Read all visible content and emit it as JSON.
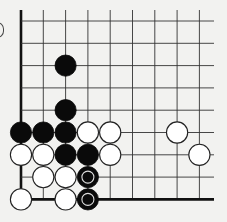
{
  "diagram": {
    "type": "go-board-corner",
    "visible_columns": 9,
    "visible_rows": 9,
    "edges": [
      "left",
      "bottom"
    ],
    "colors": {
      "background": "#f2f2f0",
      "line": "#333333",
      "black": "#0a0a0a",
      "white": "#ffffff"
    },
    "stones": [
      {
        "color": "black",
        "col": 2,
        "row": 2,
        "marked": false
      },
      {
        "color": "black",
        "col": 2,
        "row": 4,
        "marked": false
      },
      {
        "color": "black",
        "col": 0,
        "row": 5,
        "marked": false
      },
      {
        "color": "black",
        "col": 1,
        "row": 5,
        "marked": false
      },
      {
        "color": "black",
        "col": 2,
        "row": 5,
        "marked": false
      },
      {
        "color": "white",
        "col": 3,
        "row": 5,
        "marked": false
      },
      {
        "color": "white",
        "col": 4,
        "row": 5,
        "marked": false
      },
      {
        "color": "white",
        "col": 7,
        "row": 5,
        "marked": false
      },
      {
        "color": "white",
        "col": 0,
        "row": 6,
        "marked": false
      },
      {
        "color": "white",
        "col": 1,
        "row": 6,
        "marked": false
      },
      {
        "color": "black",
        "col": 2,
        "row": 6,
        "marked": false
      },
      {
        "color": "black",
        "col": 3,
        "row": 6,
        "marked": false
      },
      {
        "color": "white",
        "col": 4,
        "row": 6,
        "marked": false
      },
      {
        "color": "white",
        "col": 8,
        "row": 6,
        "marked": false
      },
      {
        "color": "white",
        "col": 1,
        "row": 7,
        "marked": false
      },
      {
        "color": "white",
        "col": 2,
        "row": 7,
        "marked": false
      },
      {
        "color": "black",
        "col": 3,
        "row": 7,
        "marked": true
      },
      {
        "color": "white",
        "col": 0,
        "row": 8,
        "marked": false
      },
      {
        "color": "white",
        "col": 2,
        "row": 8,
        "marked": false
      },
      {
        "color": "black",
        "col": 3,
        "row": 8,
        "marked": true
      }
    ]
  }
}
